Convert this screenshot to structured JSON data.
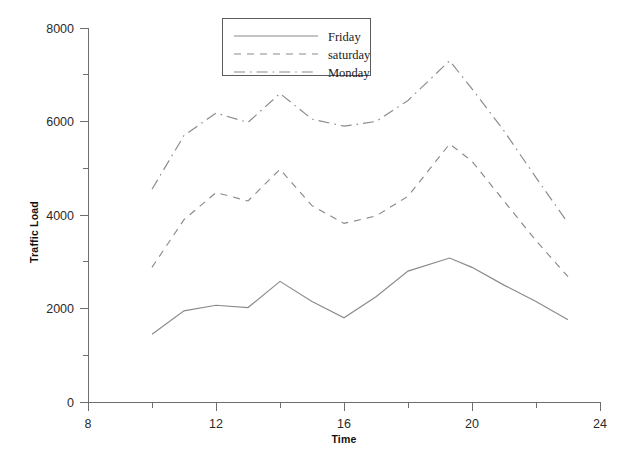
{
  "chart_data": {
    "type": "line",
    "title": "",
    "xlabel": "Time",
    "ylabel": "Traffic Load",
    "xlim": [
      8,
      24
    ],
    "ylim": [
      0,
      8000
    ],
    "grid": false,
    "legend_position": "top-center",
    "x_ticks": [
      8,
      12,
      16,
      20,
      24
    ],
    "x_tick_labels": [
      "8",
      "12",
      "16",
      "20",
      "24"
    ],
    "x_minor_ticks": [
      10,
      14,
      18,
      22
    ],
    "y_ticks": [
      0,
      2000,
      4000,
      6000,
      8000
    ],
    "y_tick_labels": [
      "0",
      "2000",
      "4000",
      "6000",
      "8000"
    ],
    "y_minor_ticks": [
      1000,
      3000,
      5000,
      7000
    ],
    "x": [
      10,
      11,
      12,
      13,
      14,
      15,
      16,
      17,
      18,
      19.3,
      20,
      21,
      22,
      23
    ],
    "series": [
      {
        "name": "Friday",
        "style": "solid",
        "color": "#8a8a8a",
        "values": [
          1450,
          1950,
          2070,
          2020,
          2580,
          2150,
          1800,
          2250,
          2800,
          3080,
          2880,
          2500,
          2150,
          1760
        ]
      },
      {
        "name": "saturday",
        "style": "dashed",
        "color": "#8a8a8a",
        "values": [
          2880,
          3900,
          4480,
          4300,
          4980,
          4200,
          3820,
          3980,
          4400,
          5520,
          5150,
          4300,
          3450,
          2680
        ]
      },
      {
        "name": "Monday",
        "style": "dashdot",
        "color": "#8a8a8a",
        "values": [
          4550,
          5700,
          6180,
          5980,
          6600,
          6050,
          5900,
          6000,
          6450,
          7300,
          6700,
          5800,
          4800,
          3830
        ]
      }
    ]
  },
  "legend": {
    "entries": [
      {
        "label": "Friday",
        "style": "solid"
      },
      {
        "label": "saturday",
        "style": "dashed"
      },
      {
        "label": "Monday",
        "style": "dashdot"
      }
    ]
  },
  "axes": {
    "x_title": "Time",
    "y_title": "Traffic Load"
  }
}
